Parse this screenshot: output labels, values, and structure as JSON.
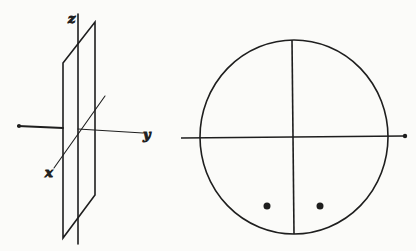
{
  "figure": {
    "left_panel": {
      "description": "3D axes with a vertical plane (yz-plane) shown as parallelogram",
      "labels": {
        "z": "z",
        "y": "y",
        "x": "x"
      }
    },
    "right_panel": {
      "description": "Circle divided by horizontal and vertical diameters with two dots in lower half",
      "dots": 2
    },
    "colors": {
      "ink": "#1e1e1e",
      "background": "#fbfbf9"
    }
  }
}
